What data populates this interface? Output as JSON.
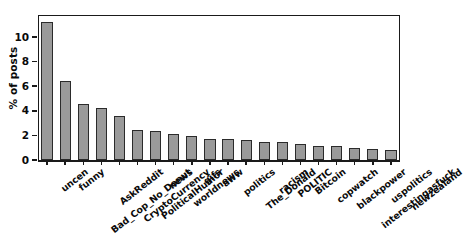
{
  "chart_data": {
    "type": "bar",
    "title": "",
    "subtitle": "",
    "xlabel": "",
    "ylabel": "% of posts",
    "ylim": [
      0,
      11.8
    ],
    "yticks": [
      0,
      2,
      4,
      6,
      8,
      10
    ],
    "ytick_labels": [
      "0",
      "2",
      "4",
      "6",
      "8",
      "10"
    ],
    "grid": false,
    "legend": null,
    "bar_color": "#9a9a9a",
    "bar_edge_color": "#2b2b2b",
    "categories": [
      "uncen",
      "funny",
      "Bad_Cop_No_Donut",
      "AskReddit",
      "CryptoCurrency",
      "PoliticalHumor",
      "news",
      "worldnews",
      "gifs",
      "aww",
      "politics",
      "The_Donald",
      "racism",
      "POLITIC",
      "Bitcoin",
      "copwatch",
      "blackpower",
      "interestingasfuck",
      "uspolitics",
      "newzealand"
    ],
    "values": [
      11.2,
      6.4,
      4.55,
      4.2,
      3.55,
      2.45,
      2.35,
      2.1,
      1.95,
      1.75,
      1.7,
      1.6,
      1.45,
      1.45,
      1.3,
      1.15,
      1.1,
      0.95,
      0.9,
      0.85
    ]
  },
  "axes": {
    "y_axis_label": "% of posts"
  }
}
